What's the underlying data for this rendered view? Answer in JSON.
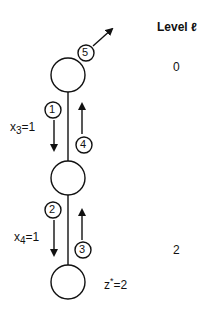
{
  "header": {
    "level_label": "Level ℓ"
  },
  "levels": [
    {
      "value": "0"
    },
    {
      "value": "2"
    }
  ],
  "edges": [
    {
      "label_var": "x",
      "label_sub": "3",
      "label_val": "=1"
    },
    {
      "label_var": "x",
      "label_sub": "4",
      "label_val": "=1"
    }
  ],
  "steps": [
    "1",
    "2",
    "3",
    "4",
    "5"
  ],
  "result": {
    "label": "z",
    "sup": "*",
    "val": "=2"
  }
}
